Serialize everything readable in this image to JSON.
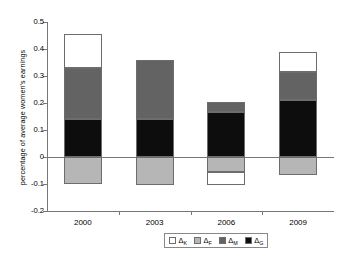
{
  "chart_data": {
    "type": "bar",
    "variant": "stacked-with-negatives",
    "title": "",
    "xlabel": "",
    "ylabel": "percentage of average women's earnings",
    "categories": [
      "2000",
      "2003",
      "2006",
      "2009"
    ],
    "ylim": [
      -0.2,
      0.5
    ],
    "yticks": [
      -0.2,
      -0.1,
      0,
      0.1,
      0.2,
      0.3,
      0.4,
      0.5
    ],
    "ytick_labels": [
      "-0.2",
      "-0.1",
      "0",
      "0.1",
      "0.2",
      "0.3",
      "0.4",
      "0.5"
    ],
    "grid": false,
    "zero_line": 0,
    "legend_position": "bottom-right",
    "series": [
      {
        "name": "ΔK",
        "label_base": "Δ",
        "label_sub": "K",
        "color": "#ffffff",
        "values": [
          0.125,
          0.0,
          0.0,
          0.075
        ]
      },
      {
        "name": "ΔF",
        "label_base": "Δ",
        "label_sub": "F",
        "color": "#b6b6b6",
        "values": [
          -0.1,
          -0.105,
          -0.055,
          -0.065
        ]
      },
      {
        "name": "ΔM",
        "label_base": "Δ",
        "label_sub": "M",
        "color": "#636363",
        "values": [
          0.19,
          0.22,
          0.04,
          0.105
        ]
      },
      {
        "name": "ΔG",
        "label_base": "Δ",
        "label_sub": "G",
        "color": "#0d0d0d",
        "values": [
          0.14,
          0.14,
          0.165,
          0.21
        ]
      }
    ],
    "bar_segments": [
      {
        "category": "2000",
        "positive_top": 0.455,
        "negative_bottom": -0.1,
        "stack": [
          {
            "series": "ΔG",
            "from": 0.0,
            "to": 0.14
          },
          {
            "series": "ΔM",
            "from": 0.14,
            "to": 0.33
          },
          {
            "series": "ΔK",
            "from": 0.33,
            "to": 0.455
          },
          {
            "series": "ΔF",
            "from": 0.0,
            "to": -0.1
          }
        ]
      },
      {
        "category": "2003",
        "positive_top": 0.36,
        "negative_bottom": -0.105,
        "stack": [
          {
            "series": "ΔG",
            "from": 0.0,
            "to": 0.14
          },
          {
            "series": "ΔM",
            "from": 0.14,
            "to": 0.36
          },
          {
            "series": "ΔF",
            "from": 0.0,
            "to": -0.105
          }
        ]
      },
      {
        "category": "2006",
        "positive_top": 0.205,
        "negative_bottom": -0.105,
        "stack": [
          {
            "series": "ΔG",
            "from": 0.0,
            "to": 0.165
          },
          {
            "series": "ΔM",
            "from": 0.165,
            "to": 0.205
          },
          {
            "series": "ΔF",
            "from": 0.0,
            "to": -0.055
          },
          {
            "series": "ΔK",
            "from": -0.055,
            "to": -0.105
          }
        ]
      },
      {
        "category": "2009",
        "positive_top": 0.39,
        "negative_bottom": -0.065,
        "stack": [
          {
            "series": "ΔG",
            "from": 0.0,
            "to": 0.21
          },
          {
            "series": "ΔM",
            "from": 0.21,
            "to": 0.315
          },
          {
            "series": "ΔK",
            "from": 0.315,
            "to": 0.39
          },
          {
            "series": "ΔF",
            "from": 0.0,
            "to": -0.065
          }
        ]
      }
    ]
  },
  "legend": {
    "items": [
      {
        "base": "Δ",
        "sub": "K",
        "swatch": "k"
      },
      {
        "base": "Δ",
        "sub": "F",
        "swatch": "f"
      },
      {
        "base": "Δ",
        "sub": "M",
        "swatch": "m"
      },
      {
        "base": "Δ",
        "sub": "G",
        "swatch": "g"
      }
    ]
  }
}
